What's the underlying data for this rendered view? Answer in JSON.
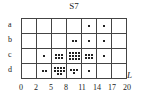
{
  "title": "S7",
  "axis_label": "L",
  "rows": [
    "a",
    "b",
    "c",
    "d"
  ],
  "x_ticks": [
    "0",
    "2",
    "5",
    "8",
    "11",
    "14",
    "17",
    "20"
  ],
  "cells": [
    [
      0,
      0,
      0,
      0,
      1,
      1,
      0
    ],
    [
      0,
      0,
      0,
      2,
      1,
      1,
      0
    ],
    [
      0,
      1,
      6,
      12,
      6,
      1,
      0
    ],
    [
      0,
      2,
      10,
      4,
      1,
      0,
      0
    ]
  ],
  "chart_data": {
    "type": "heatmap",
    "title": "S7",
    "xlabel": "L",
    "ylabel": "",
    "x_bins": [
      "0-2",
      "2-5",
      "5-8",
      "8-11",
      "11-14",
      "14-17",
      "17-20"
    ],
    "x_ticks": [
      0,
      2,
      5,
      8,
      11,
      14,
      17,
      20
    ],
    "y_categories": [
      "a",
      "b",
      "c",
      "d"
    ],
    "values": [
      [
        0,
        0,
        0,
        0,
        1,
        1,
        0
      ],
      [
        0,
        0,
        0,
        2,
        1,
        1,
        0
      ],
      [
        0,
        1,
        6,
        12,
        6,
        1,
        0
      ],
      [
        0,
        2,
        10,
        4,
        1,
        0,
        0
      ]
    ],
    "encoding": "dot count per cell"
  }
}
